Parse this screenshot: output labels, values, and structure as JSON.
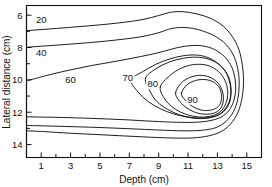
{
  "chart_data": {
    "type": "line",
    "subtype": "contour",
    "title": "",
    "xlabel": "Depth (cm)",
    "ylabel": "Lateral distance (cm)",
    "xlim": [
      0,
      16
    ],
    "ylim": [
      5.4,
      14.8
    ],
    "y_axis_inverted": true,
    "grid": false,
    "legend": "none",
    "xticks": [
      1,
      2,
      3,
      4,
      5,
      6,
      7,
      8,
      9,
      10,
      11,
      12,
      13,
      14,
      15
    ],
    "xtick_labels": [
      "1",
      "",
      "3",
      "",
      "5",
      "",
      "7",
      "",
      "9",
      "",
      "11",
      "",
      "13",
      "",
      "15"
    ],
    "yticks": [
      6,
      7,
      8,
      9,
      10,
      11,
      12,
      13,
      14
    ],
    "ytick_labels": [
      "6",
      "",
      "8",
      "",
      "10",
      "",
      "12",
      "",
      "14"
    ],
    "contour_levels": [
      20,
      40,
      60,
      70,
      80,
      90
    ],
    "contour_labels": [
      {
        "level": "20",
        "x": 1.0,
        "y": 6.45
      },
      {
        "level": "40",
        "x": 1.0,
        "y": 8.45
      },
      {
        "level": "60",
        "x": 3.0,
        "y": 10.1
      },
      {
        "level": "70",
        "x": 6.9,
        "y": 10.0
      },
      {
        "level": "80",
        "x": 8.6,
        "y": 10.4
      },
      {
        "level": "90",
        "x": 11.3,
        "y": 11.35
      }
    ],
    "series": [
      {
        "name": "20",
        "points": [
          [
            0.05,
            6.95
          ],
          [
            1.6,
            6.85
          ],
          [
            3.4,
            6.72
          ],
          [
            5.2,
            6.58
          ],
          [
            6.8,
            6.42
          ],
          [
            8.0,
            6.25
          ],
          [
            9.0,
            6.02
          ],
          [
            9.8,
            5.82
          ],
          [
            10.6,
            5.78
          ],
          [
            11.6,
            5.92
          ],
          [
            12.6,
            6.22
          ],
          [
            13.4,
            6.68
          ],
          [
            14.0,
            7.3
          ],
          [
            14.45,
            8.1
          ],
          [
            14.7,
            9.1
          ],
          [
            14.78,
            10.1
          ],
          [
            14.68,
            11.1
          ],
          [
            14.4,
            12.0
          ],
          [
            13.9,
            12.72
          ],
          [
            13.2,
            13.22
          ],
          [
            12.2,
            13.5
          ],
          [
            11.0,
            13.6
          ],
          [
            9.4,
            13.58
          ],
          [
            7.4,
            13.5
          ],
          [
            5.2,
            13.4
          ],
          [
            3.0,
            13.3
          ],
          [
            1.2,
            13.2
          ],
          [
            0.05,
            13.15
          ]
        ]
      },
      {
        "name": "40",
        "points": [
          [
            0.05,
            7.98
          ],
          [
            1.6,
            7.88
          ],
          [
            3.4,
            7.76
          ],
          [
            5.2,
            7.62
          ],
          [
            6.8,
            7.46
          ],
          [
            8.0,
            7.3
          ],
          [
            9.0,
            7.08
          ],
          [
            9.9,
            6.82
          ],
          [
            10.8,
            6.76
          ],
          [
            11.8,
            6.92
          ],
          [
            12.8,
            7.28
          ],
          [
            13.6,
            7.82
          ],
          [
            14.15,
            8.6
          ],
          [
            14.42,
            9.5
          ],
          [
            14.48,
            10.35
          ],
          [
            14.38,
            11.2
          ],
          [
            14.1,
            11.95
          ],
          [
            13.6,
            12.55
          ],
          [
            12.9,
            12.95
          ],
          [
            11.9,
            13.12
          ],
          [
            10.6,
            13.15
          ],
          [
            9.0,
            13.1
          ],
          [
            7.0,
            13.02
          ],
          [
            4.8,
            12.94
          ],
          [
            2.6,
            12.88
          ],
          [
            1.0,
            12.84
          ],
          [
            0.05,
            12.82
          ]
        ]
      },
      {
        "name": "60",
        "points": [
          [
            0.05,
            10.05
          ],
          [
            1.4,
            9.72
          ],
          [
            2.9,
            9.4
          ],
          [
            4.4,
            9.12
          ],
          [
            5.9,
            8.88
          ],
          [
            7.2,
            8.66
          ],
          [
            8.4,
            8.44
          ],
          [
            9.4,
            8.22
          ],
          [
            10.3,
            8.0
          ],
          [
            11.2,
            7.88
          ],
          [
            12.0,
            7.9
          ],
          [
            12.8,
            8.12
          ],
          [
            13.5,
            8.58
          ],
          [
            13.98,
            9.22
          ],
          [
            14.2,
            9.95
          ],
          [
            14.24,
            10.65
          ],
          [
            14.1,
            11.32
          ],
          [
            13.78,
            11.9
          ],
          [
            13.25,
            12.3
          ],
          [
            12.5,
            12.52
          ],
          [
            11.5,
            12.62
          ],
          [
            10.2,
            12.62
          ],
          [
            8.6,
            12.56
          ],
          [
            6.6,
            12.46
          ],
          [
            4.4,
            12.38
          ],
          [
            2.2,
            12.32
          ],
          [
            0.9,
            12.3
          ],
          [
            0.05,
            12.28
          ]
        ]
      },
      {
        "name": "70",
        "points": [
          [
            7.1,
            10.0
          ],
          [
            7.9,
            9.5
          ],
          [
            8.8,
            9.04
          ],
          [
            9.7,
            8.72
          ],
          [
            10.6,
            8.52
          ],
          [
            11.5,
            8.46
          ],
          [
            12.3,
            8.6
          ],
          [
            13.0,
            8.96
          ],
          [
            13.55,
            9.5
          ],
          [
            13.85,
            10.2
          ],
          [
            13.92,
            10.9
          ],
          [
            13.78,
            11.5
          ],
          [
            13.4,
            11.98
          ],
          [
            12.8,
            12.26
          ],
          [
            12.0,
            12.36
          ],
          [
            11.0,
            12.3
          ],
          [
            10.0,
            12.1
          ],
          [
            9.1,
            11.78
          ],
          [
            8.3,
            11.35
          ],
          [
            7.6,
            10.76
          ],
          [
            7.1,
            10.0
          ]
        ]
      },
      {
        "name": "80",
        "points": [
          [
            9.1,
            10.44
          ],
          [
            9.65,
            9.82
          ],
          [
            10.35,
            9.36
          ],
          [
            11.1,
            9.1
          ],
          [
            11.9,
            9.04
          ],
          [
            12.6,
            9.2
          ],
          [
            13.2,
            9.6
          ],
          [
            13.58,
            10.18
          ],
          [
            13.7,
            10.82
          ],
          [
            13.6,
            11.4
          ],
          [
            13.3,
            11.88
          ],
          [
            12.8,
            12.18
          ],
          [
            12.1,
            12.3
          ],
          [
            11.3,
            12.24
          ],
          [
            10.5,
            12.0
          ],
          [
            9.85,
            11.62
          ],
          [
            9.35,
            11.1
          ],
          [
            9.1,
            10.44
          ]
        ]
      },
      {
        "name": "90",
        "points": [
          [
            10.15,
            10.8
          ],
          [
            10.5,
            10.22
          ],
          [
            11.1,
            9.86
          ],
          [
            11.8,
            9.72
          ],
          [
            12.5,
            9.84
          ],
          [
            13.05,
            10.2
          ],
          [
            13.35,
            10.74
          ],
          [
            13.4,
            11.3
          ],
          [
            13.2,
            11.78
          ],
          [
            12.75,
            12.06
          ],
          [
            12.1,
            12.12
          ],
          [
            11.4,
            11.98
          ],
          [
            10.8,
            11.66
          ],
          [
            10.35,
            11.24
          ],
          [
            10.15,
            10.8
          ]
        ]
      },
      {
        "name": "inner-a",
        "points": [
          [
            10.55,
            10.82
          ],
          [
            10.9,
            10.32
          ],
          [
            11.5,
            10.04
          ],
          [
            12.15,
            9.98
          ],
          [
            12.75,
            10.14
          ],
          [
            13.15,
            10.52
          ],
          [
            13.28,
            11.02
          ],
          [
            13.18,
            11.5
          ],
          [
            12.8,
            11.8
          ],
          [
            12.2,
            11.9
          ],
          [
            11.6,
            11.78
          ],
          [
            11.05,
            11.48
          ],
          [
            10.7,
            11.14
          ],
          [
            10.55,
            10.82
          ]
        ]
      },
      {
        "name": "outer-b",
        "points": [
          [
            8.1,
            9.9
          ],
          [
            8.8,
            9.32
          ],
          [
            9.7,
            8.9
          ],
          [
            10.7,
            8.66
          ],
          [
            11.7,
            8.6
          ],
          [
            12.6,
            8.78
          ],
          [
            13.3,
            9.2
          ],
          [
            13.76,
            9.82
          ],
          [
            13.92,
            10.55
          ],
          [
            13.84,
            11.24
          ],
          [
            13.52,
            11.8
          ],
          [
            12.98,
            12.2
          ],
          [
            12.2,
            12.38
          ],
          [
            11.3,
            12.36
          ],
          [
            10.4,
            12.16
          ],
          [
            9.6,
            11.82
          ],
          [
            8.9,
            11.36
          ],
          [
            8.4,
            10.7
          ],
          [
            8.1,
            9.9
          ]
        ]
      }
    ]
  },
  "axes": {
    "x_title": "Depth (cm)",
    "y_title": "Lateral distance (cm)"
  }
}
